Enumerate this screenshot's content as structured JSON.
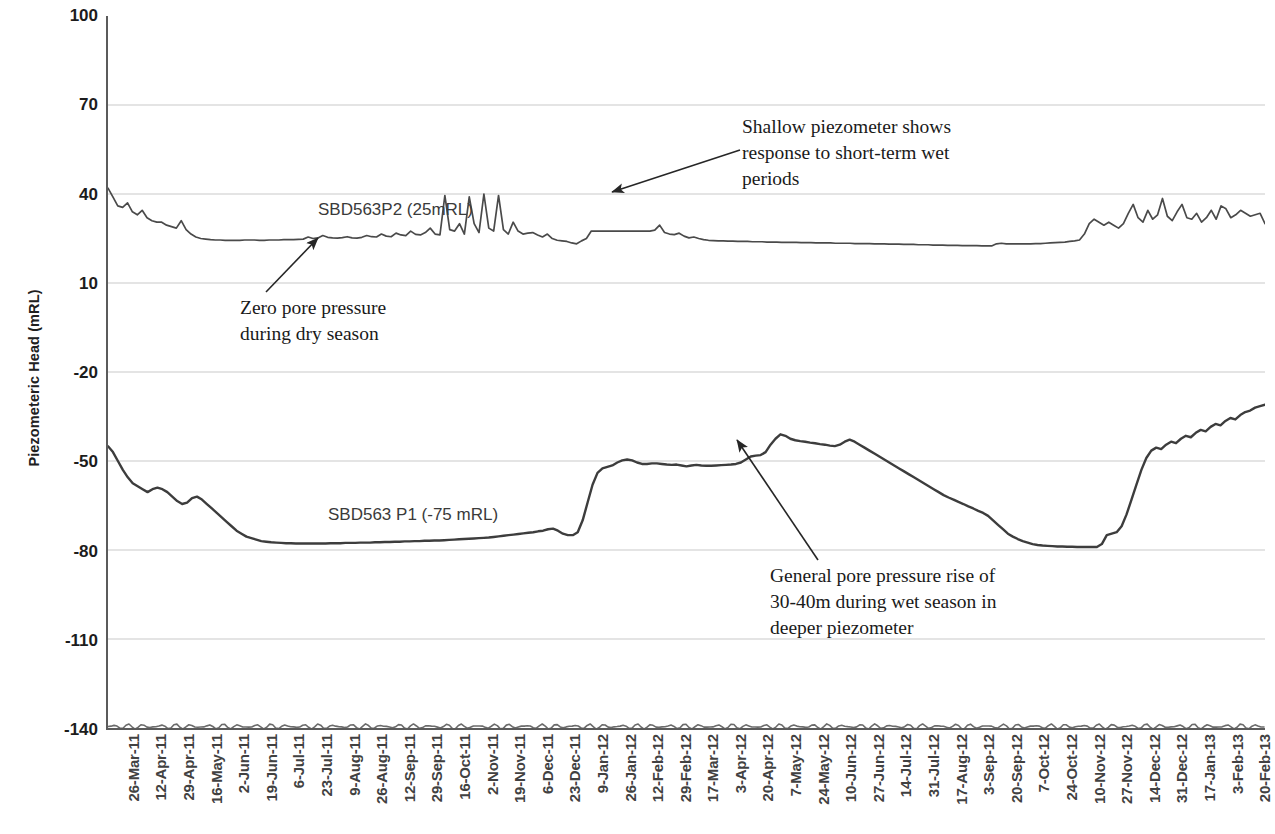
{
  "chart_data": {
    "type": "line",
    "title": "",
    "xlabel": "",
    "ylabel": "Piezometeric Head (mRL)",
    "ylim": [
      -140,
      100
    ],
    "yticks": [
      100,
      70,
      40,
      10,
      -20,
      -50,
      -80,
      -110,
      -140
    ],
    "grid": true,
    "legend_position": "inline-labels",
    "x_tick_labels": [
      "26-Mar-11",
      "12-Apr-11",
      "29-Apr-11",
      "16-May-11",
      "2-Jun-11",
      "19-Jun-11",
      "6-Jul-11",
      "23-Jul-11",
      "9-Aug-11",
      "26-Aug-11",
      "12-Sep-11",
      "29-Sep-11",
      "16-Oct-11",
      "2-Nov-11",
      "19-Nov-11",
      "6-Dec-11",
      "23-Dec-11",
      "9-Jan-12",
      "26-Jan-12",
      "12-Feb-12",
      "29-Feb-12",
      "17-Mar-12",
      "3-Apr-12",
      "20-Apr-12",
      "7-May-12",
      "24-May-12",
      "10-Jun-12",
      "27-Jun-12",
      "14-Jul-12",
      "31-Jul-12",
      "17-Aug-12",
      "3-Sep-12",
      "20-Sep-12",
      "7-Oct-12",
      "24-Oct-12",
      "10-Nov-12",
      "27-Nov-12",
      "14-Dec-12",
      "31-Dec-12",
      "17-Jan-13",
      "3-Feb-13",
      "20-Feb-13"
    ],
    "series": [
      {
        "name": "SBD563P2 (25mRL)",
        "label": "SBD563P2 (25mRL)",
        "color": "#4a4a4a",
        "values": [
          42,
          39,
          36,
          35.5,
          37,
          34,
          33,
          34.5,
          32,
          31,
          30.5,
          30.5,
          29.5,
          29,
          28.5,
          31,
          28,
          26.5,
          25.5,
          25,
          24.8,
          24.6,
          24.5,
          24.5,
          24.4,
          24.4,
          24.4,
          24.4,
          24.5,
          24.5,
          24.5,
          24.4,
          24.4,
          24.5,
          24.5,
          24.5,
          24.6,
          24.6,
          24.6,
          24.7,
          24.8,
          25.5,
          25,
          25.2,
          26,
          25.4,
          25.2,
          25.1,
          25.3,
          25.6,
          25.2,
          25.1,
          25.4,
          26,
          25.6,
          25.5,
          26.5,
          25.8,
          25.6,
          26.8,
          26.2,
          26.0,
          27.5,
          26.4,
          26.2,
          27.0,
          28.5,
          26.5,
          26.2,
          39.5,
          28,
          27.5,
          30,
          26.5,
          39,
          30,
          27,
          40,
          28.5,
          27.5,
          39.5,
          28,
          26.5,
          30.5,
          27.5,
          26.5,
          26.8,
          27.0,
          26.2,
          25.5,
          26.5,
          25.0,
          24.4,
          24.2,
          24.0,
          23.5,
          23.2,
          24.2,
          25.0,
          27.5,
          27.5,
          27.5,
          27.5,
          27.5,
          27.5,
          27.5,
          27.5,
          27.5,
          27.5,
          27.5,
          27.5,
          27.5,
          27.8,
          29.5,
          27.0,
          26.5,
          26.3,
          26.8,
          25.8,
          25.2,
          25.5,
          25.0,
          24.6,
          24.4,
          24.3,
          24.2,
          24.2,
          24.1,
          24.1,
          24.0,
          24.0,
          24.0,
          23.9,
          23.9,
          23.9,
          23.8,
          23.8,
          23.8,
          23.7,
          23.7,
          23.7,
          23.7,
          23.6,
          23.6,
          23.6,
          23.5,
          23.5,
          23.5,
          23.5,
          23.4,
          23.4,
          23.4,
          23.4,
          23.3,
          23.3,
          23.3,
          23.3,
          23.2,
          23.2,
          23.2,
          23.1,
          23.1,
          23.1,
          23.0,
          23.0,
          23.0,
          22.9,
          22.9,
          22.9,
          22.8,
          22.8,
          22.8,
          22.7,
          22.7,
          22.7,
          22.6,
          22.6,
          22.6,
          22.6,
          22.5,
          22.5,
          22.5,
          23.2,
          23.4,
          23.2,
          23.2,
          23.2,
          23.2,
          23.2,
          23.2,
          23.3,
          23.3,
          23.4,
          23.5,
          23.6,
          23.7,
          23.8,
          24.0,
          24.2,
          24.5,
          26.5,
          30,
          31.5,
          30.5,
          29.5,
          30.5,
          29.5,
          28.5,
          30,
          33.5,
          36.5,
          32,
          30.5,
          34.5,
          31.5,
          33,
          38.5,
          32.5,
          31,
          34,
          36.5,
          32,
          31.5,
          33.5,
          30.5,
          32,
          34.5,
          31.5,
          36,
          35,
          32,
          33,
          34.5,
          33.5,
          32.5,
          33,
          33.5,
          30
        ]
      },
      {
        "name": "SBD563 P1 (-75 mRL)",
        "label": "SBD563 P1 (-75 mRL)",
        "color": "#3d3d3d",
        "values": [
          -45,
          -47,
          -50,
          -53,
          -55.5,
          -57.5,
          -58.5,
          -59.5,
          -60.5,
          -59.5,
          -59,
          -59.5,
          -60.5,
          -62,
          -63.5,
          -64.5,
          -64,
          -62.5,
          -62,
          -63,
          -64.5,
          -66,
          -67.5,
          -69,
          -70.5,
          -72,
          -73.5,
          -74.5,
          -75.5,
          -76,
          -76.5,
          -77,
          -77.2,
          -77.4,
          -77.5,
          -77.6,
          -77.7,
          -77.7,
          -77.8,
          -77.8,
          -77.8,
          -77.8,
          -77.8,
          -77.8,
          -77.8,
          -77.7,
          -77.7,
          -77.7,
          -77.6,
          -77.6,
          -77.6,
          -77.5,
          -77.5,
          -77.5,
          -77.4,
          -77.4,
          -77.3,
          -77.3,
          -77.2,
          -77.2,
          -77.1,
          -77.1,
          -77.0,
          -77.0,
          -76.9,
          -76.9,
          -76.8,
          -76.8,
          -76.7,
          -76.6,
          -76.5,
          -76.4,
          -76.3,
          -76.2,
          -76.1,
          -76.0,
          -75.9,
          -75.8,
          -75.6,
          -75.4,
          -75.2,
          -75.0,
          -74.8,
          -74.6,
          -74.4,
          -74.2,
          -74.0,
          -73.7,
          -73.5,
          -73.0,
          -72.8,
          -73.5,
          -74.5,
          -75.0,
          -75.0,
          -74.0,
          -70.0,
          -64.0,
          -58.0,
          -54.0,
          -52.5,
          -52.0,
          -51.5,
          -50.5,
          -49.8,
          -49.5,
          -49.8,
          -50.5,
          -51.0,
          -51.0,
          -50.8,
          -50.8,
          -51.0,
          -51.2,
          -51.3,
          -51.2,
          -51.5,
          -51.8,
          -51.5,
          -51.3,
          -51.5,
          -51.6,
          -51.6,
          -51.5,
          -51.4,
          -51.3,
          -51.2,
          -51.0,
          -50.5,
          -49.5,
          -48.5,
          -48.2,
          -48.0,
          -47.0,
          -44.5,
          -42.5,
          -41.0,
          -41.5,
          -42.5,
          -43.0,
          -43.3,
          -43.5,
          -43.8,
          -44.0,
          -44.3,
          -44.5,
          -44.8,
          -45.0,
          -44.5,
          -43.5,
          -42.8,
          -43.5,
          -44.5,
          -45.5,
          -46.5,
          -47.5,
          -48.5,
          -49.5,
          -50.5,
          -51.5,
          -52.5,
          -53.5,
          -54.5,
          -55.5,
          -56.5,
          -57.5,
          -58.5,
          -59.5,
          -60.5,
          -61.5,
          -62.3,
          -63.0,
          -63.8,
          -64.5,
          -65.3,
          -66.0,
          -66.8,
          -67.5,
          -68.5,
          -70.0,
          -71.5,
          -73.0,
          -74.5,
          -75.5,
          -76.3,
          -77.0,
          -77.5,
          -78.0,
          -78.3,
          -78.5,
          -78.6,
          -78.7,
          -78.8,
          -78.8,
          -78.9,
          -78.9,
          -79.0,
          -79.0,
          -79.0,
          -79.0,
          -79.0,
          -78.0,
          -75.0,
          -74.5,
          -74.0,
          -72.0,
          -68.0,
          -63.0,
          -58.0,
          -53.0,
          -49.0,
          -46.5,
          -45.5,
          -46.0,
          -44.5,
          -43.5,
          -44.0,
          -42.5,
          -41.5,
          -42.0,
          -40.5,
          -39.5,
          -40.0,
          -38.5,
          -37.5,
          -38.0,
          -36.5,
          -35.5,
          -36.0,
          -34.5,
          -33.5,
          -33.0,
          -32.0,
          -31.5,
          -31.0
        ]
      },
      {
        "name": "baseline-noise",
        "label": "",
        "color": "#6b6b6b",
        "values": [
          -139.5
        ]
      }
    ],
    "annotations": [
      {
        "id": "shallow-response",
        "text": "Shallow piezometer shows\nresponse to short-term wet\nperiods",
        "arrow_from": [
          740,
          150
        ],
        "arrow_to": [
          612,
          192
        ]
      },
      {
        "id": "zero-pore-pressure",
        "text": "Zero pore pressure\nduring dry season",
        "arrow_from": [
          266,
          292
        ],
        "arrow_to": [
          318,
          238
        ]
      },
      {
        "id": "general-pore-pressure-rise",
        "text": "General pore pressure rise of\n30-40m during wet season in\ndeeper piezometer",
        "arrow_from": [
          818,
          560
        ],
        "arrow_to": [
          737,
          440
        ]
      }
    ]
  }
}
